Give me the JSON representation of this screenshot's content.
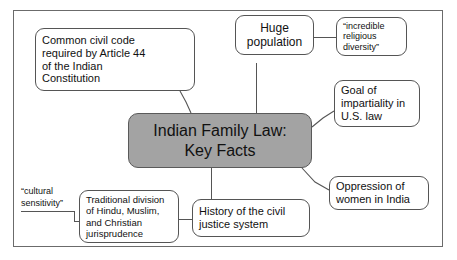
{
  "diagram": {
    "title": "Indian Family Law: Key Facts",
    "type": "mind-map",
    "frame": {
      "visible": true
    },
    "center_node": {
      "label": "Indian Family Law:\nKey Facts",
      "fill_color": "#a3a3a3",
      "border_color": "#5a5a5a",
      "text_color": "#111111"
    },
    "nodes": [
      {
        "id": "common-civil-code",
        "label": "Common civil code\nrequired by Article 44\nof the Indian\nConstitution",
        "align": "left"
      },
      {
        "id": "huge-population",
        "label": "Huge\npopulation",
        "align": "center"
      },
      {
        "id": "religious-diversity",
        "label": "“incredible\nreligious\ndiversity”",
        "align": "left"
      },
      {
        "id": "goal-impartiality",
        "label": "Goal of\nimpartiality in\nU.S. law",
        "align": "left"
      },
      {
        "id": "oppression-women",
        "label": "Oppression of\nwomen in India",
        "align": "left"
      },
      {
        "id": "history-civil-justice",
        "label": "History of the civil\njustice system",
        "align": "left"
      },
      {
        "id": "traditional-division",
        "label": "Traditional division\nof Hindu, Muslim,\nand Christian\njurisprudence",
        "align": "left"
      }
    ],
    "labels": [
      {
        "id": "cultural-sensitivity",
        "label": "“cultural\nsensitivity”"
      }
    ]
  }
}
